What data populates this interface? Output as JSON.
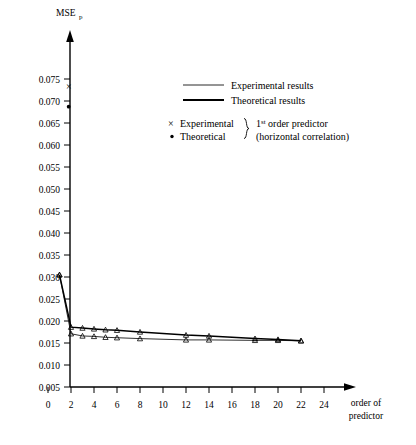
{
  "chart_data": {
    "type": "line",
    "title": "",
    "ylabel": "MSE",
    "ylabel_sub": "p",
    "xlabel_line1": "order of",
    "xlabel_line2": "predictor",
    "xlim": [
      0,
      26
    ],
    "ylim": [
      0.005,
      0.0775
    ],
    "grid": false,
    "x_ticks": [
      0,
      2,
      4,
      6,
      8,
      10,
      12,
      14,
      16,
      18,
      20,
      22,
      24
    ],
    "x_tick_labels": [
      "0",
      "2",
      "4",
      "6",
      "8",
      "10",
      "12",
      "14",
      "16",
      "18",
      "20",
      "22",
      "24"
    ],
    "y_ticks": [
      0.005,
      0.01,
      0.015,
      0.02,
      0.025,
      0.03,
      0.035,
      0.04,
      0.045,
      0.05,
      0.055,
      0.06,
      0.065,
      0.07,
      0.075
    ],
    "y_tick_labels": [
      "0.005",
      "0.010",
      "0.015",
      "0.020",
      "0.025",
      "0.030",
      "0.035",
      "0.040",
      "0.045",
      "0.050",
      "0.055",
      "0.060",
      "0.065",
      "0.070",
      "0.075"
    ],
    "series": [
      {
        "name": "Experimental results",
        "style": "thin",
        "marker": "triangle",
        "x": [
          1,
          2,
          3,
          4,
          5,
          6,
          8,
          12,
          14,
          18,
          20,
          22
        ],
        "values": [
          0.0305,
          0.0171,
          0.0166,
          0.0165,
          0.0163,
          0.0162,
          0.016,
          0.0157,
          0.0157,
          0.0156,
          0.0156,
          0.0155
        ]
      },
      {
        "name": "Theoretical results",
        "style": "thick",
        "marker": "triangle",
        "x": [
          1,
          2,
          3,
          4,
          5,
          6,
          8,
          12,
          14,
          18,
          20,
          22
        ],
        "values": [
          0.0305,
          0.0186,
          0.0184,
          0.0182,
          0.018,
          0.0179,
          0.0175,
          0.0168,
          0.0166,
          0.016,
          0.0158,
          0.0155
        ]
      }
    ],
    "points": [
      {
        "name": "Experimental 1st order predictor",
        "marker": "cross",
        "x": 1.8,
        "value": 0.0732
      },
      {
        "name": "Theoretical 1st order predictor",
        "marker": "dot",
        "x": 1.8,
        "value": 0.0687
      }
    ],
    "legend_position": "upper-right",
    "legend": {
      "line_entries": [
        {
          "label": "Experimental results",
          "style": "thin"
        },
        {
          "label": "Theoretical results",
          "style": "thick"
        }
      ],
      "marker_entries": [
        {
          "label": "Experimental",
          "marker": "cross"
        },
        {
          "label": "Theoretical",
          "marker": "dot"
        }
      ],
      "brace_note_line1_pre": "1",
      "brace_note_line1_sup": "st",
      "brace_note_line1_post": " order predictor",
      "brace_note_line2": "(horizontal correlation)"
    }
  }
}
